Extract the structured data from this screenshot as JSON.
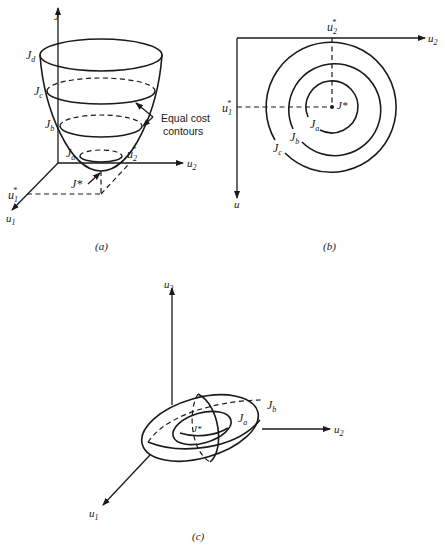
{
  "figure": {
    "panels": [
      {
        "id": "a",
        "caption": "(a)",
        "axes": {
          "vertical": "J",
          "horizontal": "u2",
          "depth": "u1"
        },
        "contour_labels": [
          "Jd",
          "Jc",
          "Jb",
          "Ja"
        ],
        "minimum_label": "J*",
        "optimum_labels": {
          "u1": "u1*",
          "u2": "u2*"
        },
        "annotation": {
          "line1": "Equal cost",
          "line2": "contours"
        }
      },
      {
        "id": "b",
        "caption": "(b)",
        "axes": {
          "horizontal": "u2",
          "vertical": "u"
        },
        "contour_labels": [
          "Ja",
          "Jb",
          "Jc"
        ],
        "minimum_label": "J*",
        "optimum_labels": {
          "u1": "u1*",
          "u2": "u2*"
        }
      },
      {
        "id": "c",
        "caption": "(c)",
        "axes": {
          "vertical": "u3",
          "horizontal": "u2",
          "depth": "u1"
        },
        "contour_labels": [
          "Ja",
          "Jb"
        ],
        "minimum_label": "J*"
      }
    ]
  },
  "labels": {
    "a_J": "J",
    "a_Jd": "J",
    "a_Jd_sub": "d",
    "a_Jc": "J",
    "a_Jc_sub": "c",
    "a_Jb": "J",
    "a_Jb_sub": "b",
    "a_Ja": "J",
    "a_Ja_sub": "a",
    "a_Jstar": "J*",
    "a_u2star": "u",
    "a_u2star_sub": "2",
    "a_u2star_sup": "*",
    "a_u1star": "u",
    "a_u1star_sub": "1",
    "a_u1star_sup": "*",
    "a_u1": "u",
    "a_u1_sub": "1",
    "a_u2": "u",
    "a_u2_sub": "2",
    "a_note1": "Equal cost",
    "a_note2": "contours",
    "a_caption": "(a)",
    "b_u2star": "u",
    "b_u2star_sub": "2",
    "b_u2star_sup": "*",
    "b_u1star": "u",
    "b_u1star_sub": "1",
    "b_u1star_sup": "*",
    "b_u2": "u",
    "b_u2_sub": "2",
    "b_u": "u",
    "b_Jstar": "J*",
    "b_Ja": "J",
    "b_Ja_sub": "a",
    "b_Jb": "J",
    "b_Jb_sub": "b",
    "b_Jc": "J",
    "b_Jc_sub": "c",
    "b_caption": "(b)",
    "c_u3": "u",
    "c_u3_sub": "3",
    "c_u2": "u",
    "c_u2_sub": "2",
    "c_u1": "u",
    "c_u1_sub": "1",
    "c_Ja": "J",
    "c_Ja_sub": "a",
    "c_Jb": "J",
    "c_Jb_sub": "b",
    "c_Jstar": "J*",
    "c_caption": "(c)"
  }
}
